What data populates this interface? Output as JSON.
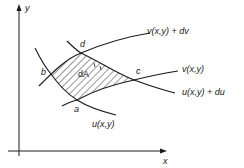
{
  "diagram": {
    "axes": {
      "x_label": "x",
      "y_label": "y"
    },
    "points": {
      "a": "a",
      "b": "b",
      "c": "c",
      "d": "d"
    },
    "area_label": "dA",
    "curves": {
      "v_plus_dv": "v(x,y) + dv",
      "v": "v(x,y)",
      "u_plus_du": "u(x,y) + du",
      "u": "u(x,y)"
    },
    "colors": {
      "ink": "#1a1a1a",
      "background": "#ffffff"
    }
  }
}
